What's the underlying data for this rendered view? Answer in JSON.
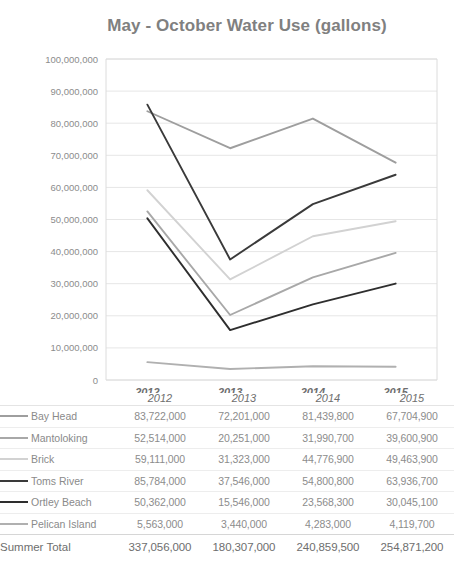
{
  "chart_data": {
    "type": "line",
    "title": "May - October Water Use (gallons)",
    "xlabel": "",
    "ylabel": "",
    "categories": [
      "2012",
      "2013",
      "2014",
      "2015"
    ],
    "ylim": [
      0,
      100000000
    ],
    "ytick_step": 10000000,
    "ytick_labels": [
      "100,000,000",
      "90,000,000",
      "80,000,000",
      "70,000,000",
      "60,000,000",
      "50,000,000",
      "40,000,000",
      "30,000,000",
      "20,000,000",
      "10,000,000",
      "0"
    ],
    "grid": true,
    "legend_position": "table-below",
    "series": [
      {
        "name": "Bay Head",
        "color": "#9e9e9e",
        "values": [
          83722000,
          72201000,
          81439800,
          67704900
        ],
        "labels": [
          "83,722,000",
          "72,201,000",
          "81,439,800",
          "67,704,900"
        ]
      },
      {
        "name": "Mantoloking",
        "color": "#a8a8a8",
        "values": [
          52514000,
          20251000,
          31990700,
          39600900
        ],
        "labels": [
          "52,514,000",
          "20,251,000",
          "31,990,700",
          "39,600,900"
        ]
      },
      {
        "name": "Brick",
        "color": "#d2d2d2",
        "values": [
          59111000,
          31323000,
          44776900,
          49463900
        ],
        "labels": [
          "59,111,000",
          "31,323,000",
          "44,776,900",
          "49,463,900"
        ]
      },
      {
        "name": "Toms River",
        "color": "#3a3a3a",
        "values": [
          85784000,
          37546000,
          54800800,
          63936700
        ],
        "labels": [
          "85,784,000",
          "37,546,000",
          "54,800,800",
          "63,936,700"
        ]
      },
      {
        "name": "Ortley Beach",
        "color": "#2e2e2e",
        "values": [
          50362000,
          15546000,
          23568300,
          30045100
        ],
        "labels": [
          "50,362,000",
          "15,546,000",
          "23,568,300",
          "30,045,100"
        ]
      },
      {
        "name": "Pelican Island",
        "color": "#b0b0b0",
        "values": [
          5563000,
          3440000,
          4283000,
          4119700
        ],
        "labels": [
          "5,563,000",
          "3,440,000",
          "4,283,000",
          "4,119,700"
        ]
      }
    ],
    "total_row": {
      "label": "Summer Total",
      "labels": [
        "337,056,000",
        "180,307,000",
        "240,859,500",
        "254,871,200"
      ],
      "values": [
        337056000,
        180307000,
        240859500,
        254871200
      ]
    }
  },
  "colors": {
    "title": "#808080",
    "axis_text": "#8c8c8c",
    "gridline": "#e6e6e6",
    "plot_border": "#dcdcdc",
    "table_rule": "#ededed"
  }
}
